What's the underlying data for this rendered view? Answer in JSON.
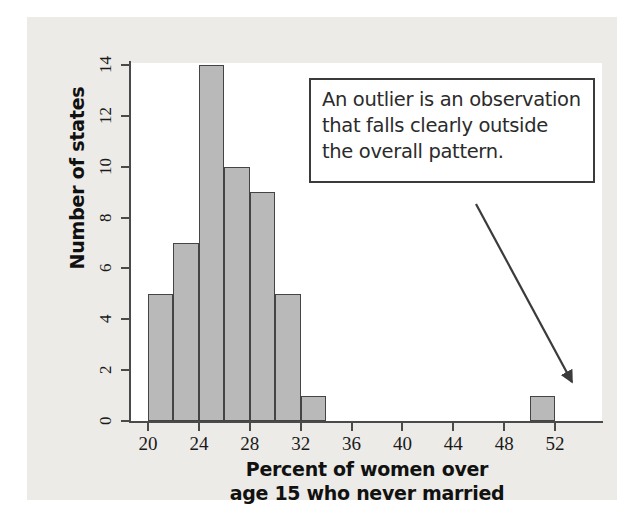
{
  "figure": {
    "kind": "histogram-figure",
    "background_color": "#ecebe7",
    "plot_background_color": "#ffffff"
  },
  "annotation": {
    "name": "outlier-callout",
    "lines": [
      "An outlier is an observation",
      "that falls clearly outside",
      "the overall pattern."
    ],
    "full_text": "An outlier is an observation that falls clearly outside the overall pattern.",
    "border_color": "#3b3b3b",
    "points_to": "outlier bar at 50-52"
  },
  "chart_data": {
    "type": "bar",
    "title": "",
    "subtitle": "",
    "xlabel": "Percent of women over age 15 who never married",
    "xlabel_lines": [
      "Percent of women over",
      "age 15 who never married"
    ],
    "ylabel": "Number of states",
    "xlim": [
      19,
      56
    ],
    "ylim": [
      0,
      14.6
    ],
    "xticks": [
      20,
      24,
      28,
      32,
      36,
      40,
      44,
      48,
      52
    ],
    "xtick_labels": [
      "20",
      "24",
      "28",
      "32",
      "36",
      "40",
      "44",
      "48",
      "52"
    ],
    "yticks": [
      0,
      2,
      4,
      6,
      8,
      10,
      12,
      14
    ],
    "ytick_labels": [
      "0",
      "2",
      "4",
      "6",
      "8",
      "10",
      "12",
      "14"
    ],
    "grid": false,
    "legend": false,
    "bin_width": 2,
    "bar_fill_color": "#b9b9b9",
    "bar_edge_color": "#444444",
    "categories": [
      "20-22",
      "22-24",
      "24-26",
      "26-28",
      "28-30",
      "30-32",
      "32-34",
      "34-36",
      "36-38",
      "38-40",
      "40-42",
      "42-44",
      "44-46",
      "46-48",
      "48-50",
      "50-52"
    ],
    "bins": [
      {
        "start": 20,
        "end": 22,
        "value": 5
      },
      {
        "start": 22,
        "end": 24,
        "value": 7
      },
      {
        "start": 24,
        "end": 26,
        "value": 14
      },
      {
        "start": 26,
        "end": 28,
        "value": 10
      },
      {
        "start": 28,
        "end": 30,
        "value": 9
      },
      {
        "start": 30,
        "end": 32,
        "value": 5
      },
      {
        "start": 32,
        "end": 34,
        "value": 1
      },
      {
        "start": 34,
        "end": 36,
        "value": 0
      },
      {
        "start": 36,
        "end": 38,
        "value": 0
      },
      {
        "start": 38,
        "end": 40,
        "value": 0
      },
      {
        "start": 40,
        "end": 42,
        "value": 0
      },
      {
        "start": 42,
        "end": 44,
        "value": 0
      },
      {
        "start": 44,
        "end": 46,
        "value": 0
      },
      {
        "start": 46,
        "end": 48,
        "value": 0
      },
      {
        "start": 48,
        "end": 50,
        "value": 0
      },
      {
        "start": 50,
        "end": 52,
        "value": 1
      }
    ],
    "values": [
      5,
      7,
      14,
      10,
      9,
      5,
      1,
      0,
      0,
      0,
      0,
      0,
      0,
      0,
      0,
      1
    ]
  }
}
